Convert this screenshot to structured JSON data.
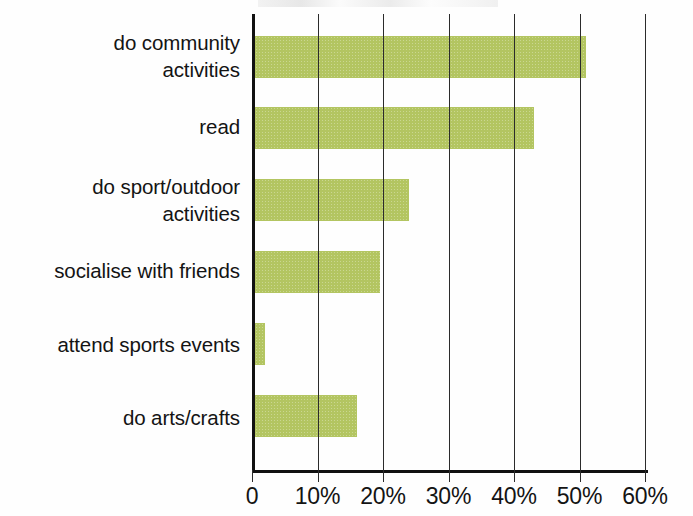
{
  "chart_data": {
    "type": "bar",
    "orientation": "horizontal",
    "title": "",
    "subtitle": "",
    "xlabel": "",
    "ylabel": "",
    "categories": [
      "do community activities",
      "read",
      "do sport/outdoor activities",
      "socialise with friends",
      "attend sports events",
      "do arts/crafts"
    ],
    "values": [
      51,
      43,
      24,
      19.5,
      2,
      16
    ],
    "xlim": [
      0,
      60
    ],
    "xticks": [
      0,
      10,
      20,
      30,
      40,
      50,
      60
    ],
    "xtick_labels": [
      "0",
      "10%",
      "20%",
      "30%",
      "40%",
      "50%",
      "60%"
    ],
    "grid": "vertical-only",
    "legend": "none",
    "series": [
      {
        "name": "",
        "values": [
          51,
          43,
          24,
          19.5,
          2,
          16
        ]
      }
    ]
  },
  "axis": {
    "x_tick_labels": [
      "0",
      "10%",
      "20%",
      "30%",
      "40%",
      "50%",
      "60%"
    ],
    "max_percent": 60
  },
  "categories": [
    {
      "line1": "do community",
      "line2": "activities"
    },
    {
      "line1": "read",
      "line2": ""
    },
    {
      "line1": "do sport/outdoor",
      "line2": "activities"
    },
    {
      "line1": "socialise with friends",
      "line2": ""
    },
    {
      "line1": "attend sports events",
      "line2": ""
    },
    {
      "line1": "do arts/crafts",
      "line2": ""
    }
  ],
  "colors": {
    "bar": "#b3c561",
    "axis": "#111111",
    "gridline": "#2b2b2b",
    "text": "#141414",
    "background": "#fefefe"
  }
}
